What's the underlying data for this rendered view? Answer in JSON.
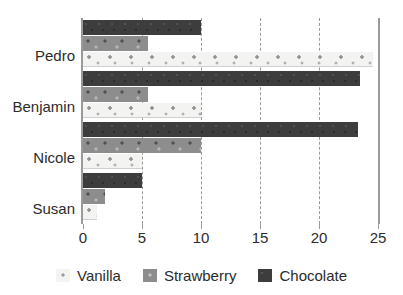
{
  "chart_data": {
    "type": "bar",
    "orientation": "horizontal",
    "title": "",
    "xlabel": "",
    "ylabel": "",
    "categories": [
      "Pedro",
      "Benjamin",
      "Nicole",
      "Susan"
    ],
    "series": [
      {
        "name": "Vanilla",
        "color": "#f3f3f1",
        "values": [
          24.6,
          10.0,
          5.0,
          1.2
        ]
      },
      {
        "name": "Strawberry",
        "color": "#8d8d8d",
        "values": [
          5.5,
          5.5,
          10.0,
          1.9
        ]
      },
      {
        "name": "Chocolate",
        "color": "#3d3d3d",
        "values": [
          10.0,
          23.5,
          23.3,
          5.0
        ]
      }
    ],
    "xlim": [
      0,
      25
    ],
    "xticks": [
      0,
      5,
      10,
      15,
      20,
      25
    ],
    "xtick_labels": [
      "0",
      "5",
      "10",
      "15",
      "20",
      "25"
    ],
    "gridlines": [
      5,
      10,
      15,
      20
    ],
    "grid": true,
    "legend_position": "bottom"
  },
  "axis": {
    "tick_labels": [
      "0",
      "5",
      "10",
      "15",
      "20",
      "25"
    ],
    "category_labels": [
      "Pedro",
      "Benjamin",
      "Nicole",
      "Susan"
    ]
  },
  "legend": {
    "items": [
      {
        "label": "Vanilla",
        "swatch": "vanilla-swatch"
      },
      {
        "label": "Strawberry",
        "swatch": "strawberry-swatch"
      },
      {
        "label": "Chocolate",
        "swatch": "chocolate-swatch"
      }
    ]
  }
}
